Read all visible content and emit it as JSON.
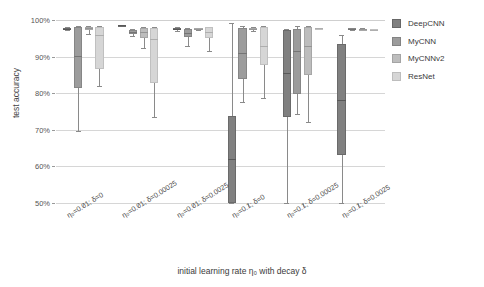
{
  "chart_data": {
    "type": "box",
    "title": "",
    "xlabel": "initial learning rate η₀ with decay δ",
    "ylabel": "test accuracy",
    "ylim": [
      50,
      100
    ],
    "yticks": [
      "50%",
      "60%",
      "70%",
      "80%",
      "90%",
      "100%"
    ],
    "ytick_values": [
      50,
      60,
      70,
      80,
      90,
      100
    ],
    "grid": true,
    "legend_position": "right",
    "categories": [
      "η₀=0.01; δ=0",
      "η₀=0.01; δ=0.00025",
      "η₀=0.01; δ=0.0025",
      "η₀=0.1; δ=0",
      "η₀=0.1; δ=0.00025",
      "η₀=0.1; δ=0.0025"
    ],
    "series": [
      {
        "name": "DeepCNN",
        "color": "#808080",
        "boxes": [
          {
            "whisker_low": 97.2,
            "q1": 97.3,
            "median": 97.6,
            "q3": 97.9,
            "whisker_high": 98.0
          },
          {
            "whisker_low": 98.3,
            "q1": 98.4,
            "median": 98.5,
            "q3": 98.6,
            "whisker_high": 98.7
          },
          {
            "whisker_low": 97.0,
            "q1": 97.2,
            "median": 97.5,
            "q3": 97.9,
            "whisker_high": 98.1
          },
          {
            "whisker_low": 50.0,
            "q1": 50.0,
            "median": 62.0,
            "q3": 73.8,
            "whisker_high": 99.2
          },
          {
            "whisker_low": 50.0,
            "q1": 73.6,
            "median": 85.6,
            "q3": 97.4,
            "whisker_high": 97.6
          },
          {
            "whisker_low": 50.0,
            "q1": 63.0,
            "median": 78.2,
            "q3": 93.4,
            "whisker_high": 96.0
          }
        ]
      },
      {
        "name": "MyCNN",
        "color": "#9c9c9c",
        "boxes": [
          {
            "whisker_low": 69.6,
            "q1": 81.4,
            "median": 90.1,
            "q3": 98.1,
            "whisker_high": 98.3
          },
          {
            "whisker_low": 95.6,
            "q1": 96.2,
            "median": 96.7,
            "q3": 97.4,
            "whisker_high": 97.6
          },
          {
            "whisker_low": 92.8,
            "q1": 95.4,
            "median": 96.5,
            "q3": 97.6,
            "whisker_high": 97.8
          },
          {
            "whisker_low": 77.6,
            "q1": 83.9,
            "median": 91.0,
            "q3": 97.9,
            "whisker_high": 98.4
          },
          {
            "whisker_low": 74.2,
            "q1": 79.9,
            "median": 91.4,
            "q3": 97.6,
            "whisker_high": 98.3
          },
          {
            "whisker_low": 97.2,
            "q1": 97.3,
            "median": 97.5,
            "q3": 97.7,
            "whisker_high": 97.8
          }
        ]
      },
      {
        "name": "MyCNNv2",
        "color": "#bdbdbd",
        "boxes": [
          {
            "whisker_low": 96.2,
            "q1": 97.2,
            "median": 97.7,
            "q3": 98.2,
            "whisker_high": 98.4
          },
          {
            "whisker_low": 92.4,
            "q1": 95.0,
            "median": 96.6,
            "q3": 97.8,
            "whisker_high": 98.0
          },
          {
            "whisker_low": 97.2,
            "q1": 97.4,
            "median": 97.6,
            "q3": 97.8,
            "whisker_high": 97.9
          },
          {
            "whisker_low": 97.1,
            "q1": 97.3,
            "median": 97.6,
            "q3": 97.9,
            "whisker_high": 98.0
          },
          {
            "whisker_low": 72.0,
            "q1": 84.9,
            "median": 92.8,
            "q3": 98.1,
            "whisker_high": 98.4
          },
          {
            "whisker_low": 97.2,
            "q1": 97.3,
            "median": 97.5,
            "q3": 97.6,
            "whisker_high": 97.7
          }
        ]
      },
      {
        "name": "ResNet",
        "color": "#d6d6d6",
        "boxes": [
          {
            "whisker_low": 81.9,
            "q1": 86.6,
            "median": 95.8,
            "q3": 98.1,
            "whisker_high": 98.4
          },
          {
            "whisker_low": 73.4,
            "q1": 82.8,
            "median": 94.8,
            "q3": 97.9,
            "whisker_high": 98.2
          },
          {
            "whisker_low": 91.4,
            "q1": 95.2,
            "median": 96.8,
            "q3": 98.0,
            "whisker_high": 98.2
          },
          {
            "whisker_low": 78.8,
            "q1": 87.8,
            "median": 92.9,
            "q3": 98.0,
            "whisker_high": 98.3
          },
          {
            "whisker_low": 97.5,
            "q1": 97.6,
            "median": 97.7,
            "q3": 97.8,
            "whisker_high": 97.9
          },
          {
            "whisker_low": 97.2,
            "q1": 97.3,
            "median": 97.4,
            "q3": 97.5,
            "whisker_high": 97.6
          }
        ]
      }
    ]
  },
  "legend": {
    "items": [
      {
        "label": "DeepCNN",
        "color": "#808080"
      },
      {
        "label": "MyCNN",
        "color": "#9c9c9c"
      },
      {
        "label": "MyCNNv2",
        "color": "#bdbdbd"
      },
      {
        "label": "ResNet",
        "color": "#d6d6d6"
      }
    ]
  }
}
